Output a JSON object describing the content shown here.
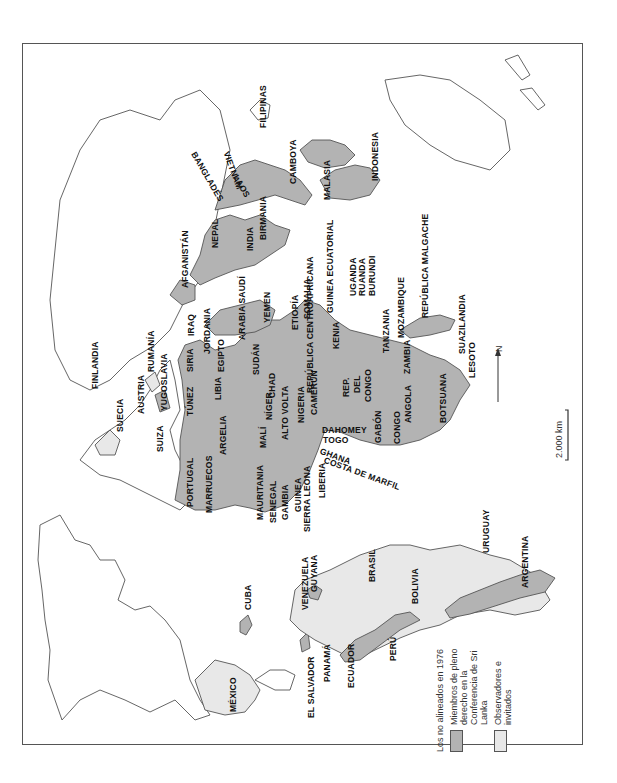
{
  "map": {
    "title": "Los no alineados en 1976",
    "orientation": "rotated 90° counter-clockwise (north points left)",
    "colors": {
      "member": "#b3b3b3",
      "observer": "#e8e8e8",
      "non_member": "#ffffff",
      "border": "#555555"
    },
    "legend": {
      "title": "Los no alineados en 1976",
      "items": [
        {
          "label": "Miembros de pleno derecho en la Conferencia de Sri Lanka",
          "swatch": "member"
        },
        {
          "label": "Observadores e invitados",
          "swatch": "observer"
        }
      ]
    },
    "scale_bar": {
      "label": "2.000 km"
    },
    "north_arrow": {
      "label": "N"
    },
    "labels": {
      "americas": [
        "MÉXICO",
        "CUBA",
        "EL SALVADOR",
        "PANAMÁ",
        "ECUADOR",
        "PERÚ",
        "VENEZUELA",
        "GUYANA",
        "BRASIL",
        "BOLIVIA",
        "URUGUAY",
        "ARGENTINA"
      ],
      "europe": [
        "PORTUGAL",
        "SUECIA",
        "SUIZA",
        "AUSTRIA",
        "YUGOSLAVIA",
        "RUMANÍA",
        "FINLANDIA"
      ],
      "africa_north": [
        "MARRUECOS",
        "ARGELIA",
        "TÚNEZ",
        "LIBIA",
        "EGIPTO",
        "SUDÁN"
      ],
      "africa_west": [
        "MAURITANIA",
        "SENEGAL",
        "GAMBIA",
        "GUINEA",
        "SIERRA LEONA",
        "LIBERIA",
        "COSTA DE MARFIL",
        "GHANA",
        "TOGO",
        "DAHOMEY",
        "MALÍ",
        "NÍGER",
        "ALTO VOLTA",
        "NIGERIA",
        "CHAD",
        "CAMERÚN"
      ],
      "africa_central_east": [
        "REPÚBLICA CENTROAFRICANA",
        "GUINEA ECUATORIAL",
        "ETIOPÍA",
        "SOMALIA",
        "KENIA",
        "UGANDA",
        "RUANDA",
        "BURUNDI",
        "REP. DEL CONGO",
        "GABÓN",
        "CONGO",
        "TANZANIA"
      ],
      "africa_south": [
        "ANGOLA",
        "ZAMBIA",
        "MOZAMBIQUE",
        "BOTSUANA",
        "LESOTO",
        "SUAZILANDIA",
        "REPÚBLICA MALGACHE"
      ],
      "middle_east": [
        "SIRIA",
        "IRAQ",
        "JORDANIA",
        "ARABIA SAUDÍ",
        "YEMEN",
        "AFGANISTÁN"
      ],
      "asia": [
        "NEPAL",
        "INDIA",
        "BANGLADESH",
        "BIRMANIA",
        "LAOS",
        "VIETNAM",
        "CAMBOYA",
        "MALASIA",
        "INDONESIA",
        "FILIPINAS"
      ]
    }
  },
  "placed_labels": [
    {
      "id": "mexico",
      "text": "MÉXICO",
      "x": 228,
      "y": 712
    },
    {
      "id": "cuba",
      "text": "CUBA",
      "x": 243,
      "y": 610
    },
    {
      "id": "el-salvador",
      "text": "EL SALVADOR",
      "x": 306,
      "y": 718
    },
    {
      "id": "panama",
      "text": "PANAMÁ",
      "x": 322,
      "y": 682
    },
    {
      "id": "ecuador",
      "text": "ECUADOR",
      "x": 346,
      "y": 688
    },
    {
      "id": "peru",
      "text": "PERÚ",
      "x": 388,
      "y": 661
    },
    {
      "id": "venezuela",
      "text": "VENEZUELA",
      "x": 300,
      "y": 610
    },
    {
      "id": "guyana",
      "text": "GUYANA",
      "x": 309,
      "y": 592
    },
    {
      "id": "brasil",
      "text": "BRASIL",
      "x": 367,
      "y": 582
    },
    {
      "id": "bolivia",
      "text": "BOLIVIA",
      "x": 410,
      "y": 604
    },
    {
      "id": "uruguay",
      "text": "URUGUAY",
      "x": 481,
      "y": 553
    },
    {
      "id": "argentina",
      "text": "ARGENTINA",
      "x": 520,
      "y": 588
    },
    {
      "id": "portugal",
      "text": "PORTUGAL",
      "x": 185,
      "y": 507
    },
    {
      "id": "suecia",
      "text": "SUECIA",
      "x": 115,
      "y": 432
    },
    {
      "id": "suiza",
      "text": "SUIZA",
      "x": 155,
      "y": 452
    },
    {
      "id": "austria",
      "text": "AUSTRIA",
      "x": 136,
      "y": 414
    },
    {
      "id": "yugoslavia",
      "text": "YUGOSLAVIA",
      "x": 159,
      "y": 411
    },
    {
      "id": "rumania",
      "text": "RUMANÍA",
      "x": 146,
      "y": 372
    },
    {
      "id": "finlandia",
      "text": "FINLANDIA",
      "x": 90,
      "y": 389
    },
    {
      "id": "marruecos",
      "text": "MARRUECOS",
      "x": 204,
      "y": 513
    },
    {
      "id": "argelia",
      "text": "ARGELIA",
      "x": 218,
      "y": 455
    },
    {
      "id": "tunez",
      "text": "TÚNEZ",
      "x": 185,
      "y": 416
    },
    {
      "id": "libia",
      "text": "LIBIA",
      "x": 213,
      "y": 400
    },
    {
      "id": "egipto",
      "text": "EGIPTO",
      "x": 216,
      "y": 372
    },
    {
      "id": "sudan",
      "text": "SUDÁN",
      "x": 251,
      "y": 375
    },
    {
      "id": "siria",
      "text": "SIRIA",
      "x": 185,
      "y": 372
    },
    {
      "id": "iraq",
      "text": "IRAQ",
      "x": 186,
      "y": 336
    },
    {
      "id": "jordania",
      "text": "JORDANIA",
      "x": 202,
      "y": 354
    },
    {
      "id": "arabia",
      "text": "ARABIA SAUDÍ",
      "x": 237,
      "y": 340
    },
    {
      "id": "yemen",
      "text": "YEMEN",
      "x": 262,
      "y": 323
    },
    {
      "id": "afganistan",
      "text": "AFGANISTÁN",
      "x": 180,
      "y": 288
    },
    {
      "id": "mauritania",
      "text": "MAURITANIA",
      "x": 255,
      "y": 520
    },
    {
      "id": "senegal",
      "text": "SENEGAL",
      "x": 268,
      "y": 523
    },
    {
      "id": "gambia",
      "text": "GAMBIA",
      "x": 280,
      "y": 520
    },
    {
      "id": "guinea",
      "text": "GUINEA",
      "x": 293,
      "y": 512
    },
    {
      "id": "sierra-leona",
      "text": "SIERRA LEONA",
      "x": 302,
      "y": 532
    },
    {
      "id": "liberia",
      "text": "LIBERIA",
      "x": 317,
      "y": 498
    },
    {
      "id": "mali",
      "text": "MALÍ",
      "x": 258,
      "y": 448
    },
    {
      "id": "niger",
      "text": "NÍGER",
      "x": 264,
      "y": 420
    },
    {
      "id": "alto-volta",
      "text": "ALTO VOLTA",
      "x": 280,
      "y": 440
    },
    {
      "id": "nigeria",
      "text": "NIGERIA",
      "x": 296,
      "y": 423
    },
    {
      "id": "chad",
      "text": "CHAD",
      "x": 267,
      "y": 398
    },
    {
      "id": "camerun",
      "text": "CAMERÚN",
      "x": 309,
      "y": 415
    },
    {
      "id": "rep-centroafricana",
      "text": "REPÚBLICA CENTROAFRICANA",
      "x": 305,
      "y": 393
    },
    {
      "id": "guinea-ecuatorial",
      "text": "GUINEA ECUATORIAL",
      "x": 325,
      "y": 313
    },
    {
      "id": "etiopia",
      "text": "ETIOPÍA",
      "x": 290,
      "y": 330
    },
    {
      "id": "somalia",
      "text": "SOMALIA",
      "x": 302,
      "y": 319
    },
    {
      "id": "kenia",
      "text": "KENIA",
      "x": 331,
      "y": 349
    },
    {
      "id": "uganda",
      "text": "UGANDA",
      "x": 348,
      "y": 296
    },
    {
      "id": "ruanda",
      "text": "RUANDA",
      "x": 357,
      "y": 296
    },
    {
      "id": "burundi",
      "text": "BURUNDI",
      "x": 367,
      "y": 296
    },
    {
      "id": "rep-congo-1",
      "text": "REP.",
      "x": 341,
      "y": 397
    },
    {
      "id": "rep-congo-2",
      "text": "DEL",
      "x": 352,
      "y": 393
    },
    {
      "id": "rep-congo-3",
      "text": "CONGO",
      "x": 363,
      "y": 402
    },
    {
      "id": "tanzania",
      "text": "TANZANIA",
      "x": 381,
      "y": 353
    },
    {
      "id": "mozambique",
      "text": "MOZAMBIQUE",
      "x": 396,
      "y": 338
    },
    {
      "id": "zambia",
      "text": "ZAMBIA",
      "x": 402,
      "y": 374
    },
    {
      "id": "angola",
      "text": "ANGOLA",
      "x": 403,
      "y": 423
    },
    {
      "id": "botsuana",
      "text": "BOTSUANA",
      "x": 438,
      "y": 423
    },
    {
      "id": "suazilandia",
      "text": "SUAZILANDIA",
      "x": 457,
      "y": 354
    },
    {
      "id": "lesoto",
      "text": "LESOTO",
      "x": 467,
      "y": 378
    },
    {
      "id": "republica-malgache",
      "text": "REPÚBLICA MALGACHE",
      "x": 420,
      "y": 318
    },
    {
      "id": "gabon",
      "text": "GABÓN",
      "x": 373,
      "y": 443
    },
    {
      "id": "congo",
      "text": "CONGO",
      "x": 392,
      "y": 444
    },
    {
      "id": "nepal",
      "text": "NEPAL",
      "x": 210,
      "y": 248
    },
    {
      "id": "india",
      "text": "INDIA",
      "x": 245,
      "y": 251
    },
    {
      "id": "birmania",
      "text": "BIRMANIA",
      "x": 258,
      "y": 240
    },
    {
      "id": "malasia",
      "text": "MALASIA",
      "x": 322,
      "y": 200
    },
    {
      "id": "camboya",
      "text": "CAMBOYA",
      "x": 288,
      "y": 184
    },
    {
      "id": "indonesia",
      "text": "INDONESIA",
      "x": 370,
      "y": 181
    },
    {
      "id": "filipinas",
      "text": "FILIPINAS",
      "x": 258,
      "y": 128
    }
  ],
  "rotated_labels": [
    {
      "id": "costa-de-marfil",
      "text": "COSTA DE MARFIL",
      "x": 326,
      "y": 455,
      "angle": 20
    },
    {
      "id": "ghana",
      "text": "GHANA",
      "x": 322,
      "y": 446,
      "angle": 20
    },
    {
      "id": "togo",
      "text": "TOGO",
      "x": 323,
      "y": 435,
      "angle": 0
    },
    {
      "id": "dahomey",
      "text": "DAHOMEY",
      "x": 322,
      "y": 425,
      "angle": 0
    },
    {
      "id": "vietnam",
      "text": "VIETNAM",
      "x": 231,
      "y": 150,
      "angle": 70
    },
    {
      "id": "laos",
      "text": "LAOS",
      "x": 240,
      "y": 173,
      "angle": 60
    },
    {
      "id": "bangladesh",
      "text": "BANGLADÉS",
      "x": 198,
      "y": 150,
      "angle": 60
    }
  ]
}
